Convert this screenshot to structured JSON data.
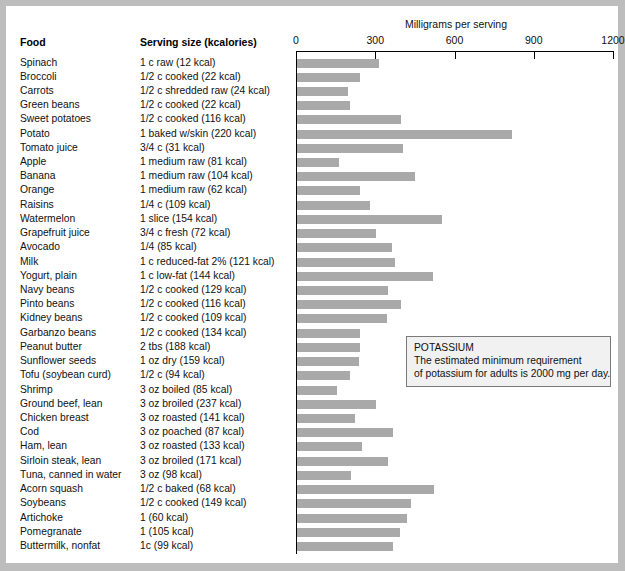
{
  "header": {
    "food_column": "Food",
    "serving_column": "Serving size (kcalories)",
    "axis_title": "Milligrams per serving"
  },
  "callout": {
    "title": "POTASSIUM",
    "line1": "The estimated minimum requirement",
    "line2": "of potassium for adults is 2000 mg per day."
  },
  "colors": {
    "bar": "#a9a9a9",
    "axis": "#000000",
    "callout_bg": "#f1f1f1",
    "callout_border": "#7a7a7a",
    "page_bg": "#ffffff",
    "frame": "#bdbdbd"
  },
  "chart_data": {
    "type": "bar",
    "orientation": "horizontal",
    "title": "",
    "xlabel": "Milligrams per serving",
    "ylabel": "Food",
    "xlim": [
      0,
      1200
    ],
    "xticks": [
      0,
      300,
      600,
      900,
      1200
    ],
    "grid": false,
    "legend": null,
    "annotations": [
      "POTASSIUM",
      "The estimated minimum requirement",
      "of potassium for adults is 2000 mg per day."
    ],
    "categories": [
      "Spinach",
      "Broccoli",
      "Carrots",
      "Green beans",
      "Sweet potatoes",
      "Potato",
      "Tomato juice",
      "Apple",
      "Banana",
      "Orange",
      "Raisins",
      "Watermelon",
      "Grapefruit juice",
      "Avocado",
      "Milk",
      "Yogurt, plain",
      "Navy beans",
      "Pinto beans",
      "Kidney beans",
      "Garbanzo beans",
      "Peanut butter",
      "Sunflower seeds",
      "Tofu (soybean curd)",
      "Shrimp",
      "Ground beef, lean",
      "Chicken breast",
      "Cod",
      "Ham, lean",
      "Sirloin steak, lean",
      "Tuna, canned in water",
      "Acorn squash",
      "Soybeans",
      "Artichoke",
      "Pomegranate",
      "Buttermilk, nonfat"
    ],
    "serving_sizes": [
      "1 c raw (12 kcal)",
      "1/2 c cooked (22 kcal)",
      "1/2 c shredded raw (24 kcal)",
      "1/2 c cooked (22 kcal)",
      "1/2 c cooked (116 kcal)",
      "1 baked w/skin (220 kcal)",
      "3/4 c (31 kcal)",
      "1 medium raw (81 kcal)",
      "1 medium raw (104 kcal)",
      "1 medium raw (62 kcal)",
      "1/4 c (109 kcal)",
      "1 slice (154 kcal)",
      "3/4 c fresh (72 kcal)",
      "1/4 (85 kcal)",
      "1 c reduced-fat 2% (121 kcal)",
      "1 c low-fat (144 kcal)",
      "1/2 c cooked (129 kcal)",
      "1/2 c cooked (116 kcal)",
      "1/2 c cooked (109 kcal)",
      "1/2 c cooked (134 kcal)",
      "2 tbs (188 kcal)",
      "1 oz dry (159 kcal)",
      "1/2 c (94 kcal)",
      "3 oz boiled (85 kcal)",
      "3 oz broiled (237 kcal)",
      "3 oz roasted (141 kcal)",
      "3 oz poached (87 kcal)",
      "3 oz roasted (133 kcal)",
      "3 oz broiled (171 kcal)",
      "3 oz (98 kcal)",
      "1/2 c baked (68 kcal)",
      "1/2 c cooked (149 kcal)",
      "1 (60 kcal)",
      "1 (105 kcal)",
      "1c (99 kcal)"
    ],
    "values": [
      312,
      238,
      193,
      200,
      395,
      815,
      400,
      160,
      445,
      240,
      275,
      550,
      300,
      360,
      370,
      515,
      345,
      395,
      340,
      240,
      240,
      235,
      200,
      150,
      300,
      220,
      365,
      245,
      345,
      205,
      520,
      430,
      415,
      390,
      365
    ],
    "units": "mg"
  }
}
